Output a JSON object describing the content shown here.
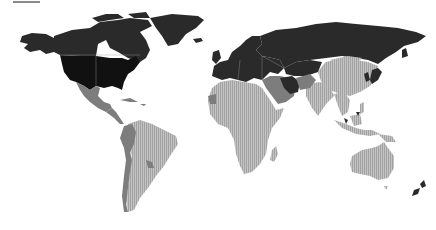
{
  "map": {
    "type": "choropleth",
    "projection": "world",
    "color_scale": {
      "black": "#111111",
      "dark": "#2a2a2a",
      "mid": "#7d7d7d",
      "light_hatched": "#b4b4b4",
      "background": "#ffffff"
    },
    "legend_bar_color": "#8a8a8a",
    "regions": [
      {
        "name": "United States",
        "shade": "black"
      },
      {
        "name": "Canada",
        "shade": "dark"
      },
      {
        "name": "Alaska",
        "shade": "dark"
      },
      {
        "name": "Greenland",
        "shade": "dark"
      },
      {
        "name": "Mexico",
        "shade": "mid"
      },
      {
        "name": "Central America",
        "shade": "mid"
      },
      {
        "name": "South America West Coast",
        "shade": "mid"
      },
      {
        "name": "South America",
        "shade": "light_hatched"
      },
      {
        "name": "Europe",
        "shade": "dark"
      },
      {
        "name": "Russia",
        "shade": "dark"
      },
      {
        "name": "Middle East",
        "shade": "mid"
      },
      {
        "name": "Africa",
        "shade": "light_hatched"
      },
      {
        "name": "China",
        "shade": "light_hatched"
      },
      {
        "name": "India",
        "shade": "light_hatched"
      },
      {
        "name": "Southeast Asia",
        "shade": "light_hatched"
      },
      {
        "name": "Japan",
        "shade": "dark"
      },
      {
        "name": "Australia",
        "shade": "light_hatched"
      },
      {
        "name": "New Zealand",
        "shade": "dark"
      }
    ]
  }
}
